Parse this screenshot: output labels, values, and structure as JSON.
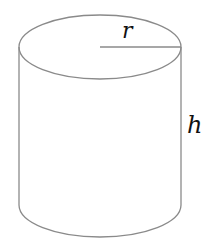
{
  "diagram": {
    "type": "cylinder",
    "labels": {
      "radius": "r",
      "height": "h"
    },
    "colors": {
      "stroke": "#8a8a8a",
      "text": "#111111",
      "background": "#ffffff"
    }
  }
}
